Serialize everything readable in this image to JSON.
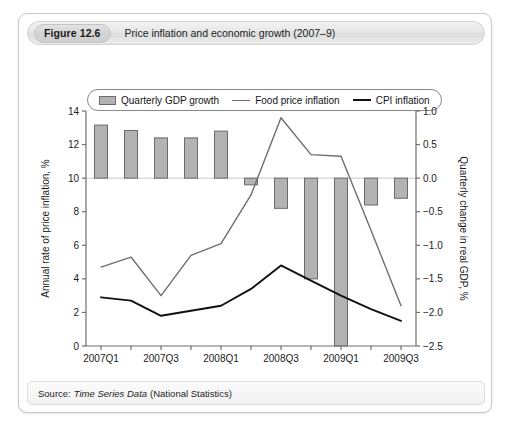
{
  "figure": {
    "number": "Figure 12.6",
    "title": "Price inflation and economic growth (2007–9)",
    "source_label": "Source:",
    "source_title": "Time Series Data",
    "source_publisher": "(National Statistics)"
  },
  "legend": {
    "position": "top-inside",
    "items": [
      {
        "label": "Quarterly GDP growth",
        "marker": "bar-swatch",
        "color": "#b3b3b3"
      },
      {
        "label": "Food price inflation",
        "marker": "line-swatch",
        "color": "#6e6e6e"
      },
      {
        "label": "CPI inflation",
        "marker": "line-swatch",
        "color": "#111111"
      }
    ]
  },
  "chart_data": {
    "type": "bar",
    "title": "Price inflation and economic growth (2007–9)",
    "xlabel": "",
    "ylabel": "Annual rate of price inflation, %",
    "y2label": "Quarterly change in real GDP, %",
    "ylim": [
      0,
      14
    ],
    "y2lim": [
      -2.5,
      1.0
    ],
    "grid": false,
    "categories": [
      "2007Q1",
      "2007Q2",
      "2007Q3",
      "2007Q4",
      "2008Q1",
      "2008Q2",
      "2008Q3",
      "2008Q4",
      "2009Q1",
      "2009Q2",
      "2009Q3"
    ],
    "x_tick_labels": [
      "2007Q1",
      "",
      "2007Q3",
      "",
      "2008Q1",
      "",
      "2008Q3",
      "",
      "2009Q1",
      "",
      "2009Q3"
    ],
    "y_ticks": [
      0,
      2,
      4,
      6,
      8,
      10,
      12,
      14
    ],
    "y2_ticks": [
      -2.5,
      -2.0,
      -1.5,
      -1.0,
      -0.5,
      0.0,
      0.5,
      1.0
    ],
    "series": [
      {
        "name": "Quarterly GDP growth",
        "type": "bar",
        "axis": "right",
        "color": "#b3b3b3",
        "edge_color": "#6b6b6b",
        "values": [
          0.79,
          0.71,
          0.6,
          0.6,
          0.7,
          -0.1,
          -0.45,
          -1.5,
          -2.5,
          -0.4,
          -0.3
        ]
      },
      {
        "name": "Food price inflation",
        "type": "line",
        "axis": "left",
        "color": "#6e6e6e",
        "values": [
          4.7,
          5.3,
          3.0,
          5.4,
          6.1,
          9.0,
          13.6,
          11.4,
          11.3,
          6.9,
          2.4
        ]
      },
      {
        "name": "CPI inflation",
        "type": "line",
        "axis": "left",
        "color": "#111111",
        "values": [
          2.9,
          2.7,
          1.8,
          2.1,
          2.4,
          3.4,
          4.8,
          3.9,
          3.0,
          2.2,
          1.5
        ]
      }
    ]
  }
}
